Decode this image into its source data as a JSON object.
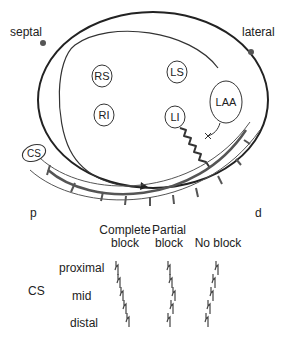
{
  "diagram": {
    "orientation_labels": {
      "septal": "septal",
      "lateral": "lateral",
      "proximal_end": "p",
      "distal_end": "d"
    },
    "structures": [
      {
        "id": "RS",
        "label": "RS"
      },
      {
        "id": "RI",
        "label": "RI"
      },
      {
        "id": "LS",
        "label": "LS"
      },
      {
        "id": "LI",
        "label": "LI"
      },
      {
        "id": "LAA",
        "label": "LAA"
      },
      {
        "id": "CS",
        "label": "CS"
      }
    ],
    "colors": {
      "line": "#222222",
      "catheter": "#555555",
      "text": "#222222"
    }
  },
  "table": {
    "row_group_label": "CS",
    "columns": [
      {
        "line1": "Complete",
        "line2": "block"
      },
      {
        "line1": "Partial",
        "line2": "block"
      },
      {
        "line1": "",
        "line2": "No block"
      }
    ],
    "rows": [
      "proximal",
      "mid",
      "distal"
    ]
  }
}
